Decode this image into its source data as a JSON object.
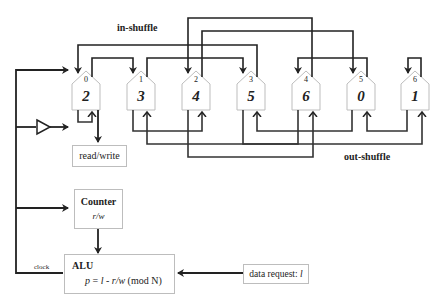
{
  "labels": {
    "in_shuffle": "in-shuffle",
    "out_shuffle": "out-shuffle",
    "read_write": "read/write",
    "clock": "clock"
  },
  "counter": {
    "title": "Counter",
    "value": "r/w"
  },
  "alu": {
    "title": "ALU",
    "formula_p": "p",
    "formula_eq": " = ",
    "formula_l": "l",
    "formula_minus": " - ",
    "formula_rw": "r/w",
    "formula_mod": " (mod N)"
  },
  "data_request": {
    "label": "data request: ",
    "var": "l"
  },
  "cells": [
    {
      "index": "0",
      "value": "2"
    },
    {
      "index": "1",
      "value": "3"
    },
    {
      "index": "2",
      "value": "4"
    },
    {
      "index": "3",
      "value": "5"
    },
    {
      "index": "4",
      "value": "6"
    },
    {
      "index": "5",
      "value": "0"
    },
    {
      "index": "6",
      "value": "1"
    }
  ],
  "colors": {
    "wire": "#222222",
    "box_border": "#bdbdbd"
  }
}
